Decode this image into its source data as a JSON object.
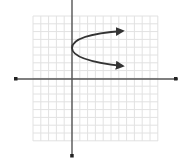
{
  "chart_data": {
    "type": "line",
    "title": "",
    "xlabel": "",
    "ylabel": "",
    "grid": true,
    "xlim": [
      -5,
      11
    ],
    "ylim": [
      -8,
      8
    ],
    "series": [
      {
        "name": "parabola",
        "equation": "x = (y - 4)^2 / 1.8",
        "vertex": [
          0,
          4
        ],
        "opens": "right",
        "points": [
          [
            7,
            6.3
          ],
          [
            3,
            5.3
          ],
          [
            1,
            4.75
          ],
          [
            0,
            4
          ],
          [
            1,
            3.25
          ],
          [
            3,
            2.7
          ],
          [
            7,
            1.7
          ]
        ],
        "arrows": "both-ends",
        "color": "#333333"
      }
    ]
  },
  "colors": {
    "grid": "#e2e2e2",
    "axis": "#555555",
    "curve": "#333333",
    "background": "#ffffff"
  }
}
